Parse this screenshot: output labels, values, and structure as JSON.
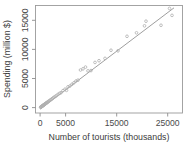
{
  "chart_data": {
    "type": "scatter",
    "title": "",
    "xlabel": "Number of tourists (thousands)",
    "ylabel": "Spending (million $)",
    "xlim": [
      -900,
      28500
    ],
    "ylim": [
      -900,
      17600
    ],
    "xticks": [
      0,
      5000,
      15000,
      25000
    ],
    "xtick_labels": [
      "0",
      "5000",
      "15000",
      "25000"
    ],
    "yticks": [
      0,
      5000,
      10000,
      15000
    ],
    "ytick_labels": [
      "0",
      "5000",
      "10000",
      "15000"
    ],
    "grid": false,
    "legend": "none",
    "point_marker": "open-circle",
    "point_color": "#b0b0b0",
    "line_color": "#8c8c8c",
    "frame_color": "#9a9a9a",
    "background_color": "#ffffff",
    "series": [
      {
        "name": "Countries",
        "x": [
          120,
          180,
          240,
          300,
          360,
          420,
          480,
          540,
          600,
          660,
          720,
          800,
          880,
          950,
          1020,
          1100,
          1180,
          1260,
          1350,
          1450,
          1550,
          1700,
          1850,
          2000,
          2200,
          2400,
          2600,
          2800,
          3050,
          3300,
          3600,
          3900,
          4200,
          4600,
          5000,
          5300,
          5600,
          6000,
          6400,
          6800,
          7200,
          7600,
          8100,
          8600,
          9100,
          9600,
          10200,
          11000,
          11800,
          13000,
          14200,
          15600,
          17400,
          19300,
          20900,
          21200,
          24200,
          25900,
          26400
        ],
        "y": [
          80,
          120,
          160,
          200,
          240,
          270,
          310,
          350,
          390,
          430,
          470,
          520,
          570,
          620,
          660,
          710,
          760,
          810,
          870,
          930,
          1000,
          1100,
          1180,
          1300,
          1400,
          1550,
          1680,
          1800,
          1950,
          2100,
          2300,
          2480,
          2600,
          2950,
          3200,
          3000,
          3600,
          3750,
          4050,
          4300,
          4600,
          4750,
          6500,
          6700,
          7000,
          6350,
          6400,
          7800,
          8100,
          8500,
          9900,
          9800,
          12300,
          12900,
          14100,
          14900,
          14200,
          17100,
          15900
        ]
      }
    ],
    "fit_line": {
      "name": "regression line",
      "x": [
        0,
        26800
      ],
      "y": [
        -250,
        17200
      ]
    }
  },
  "figure": {
    "width": 191,
    "height": 152
  }
}
